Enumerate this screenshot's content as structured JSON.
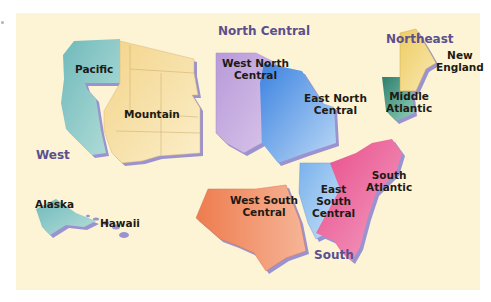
{
  "map": {
    "title": "United States Census Regions and Divisions",
    "regions": [
      {
        "name": "West",
        "divisions": [
          "Pacific",
          "Mountain"
        ]
      },
      {
        "name": "North Central",
        "divisions": [
          "West North Central",
          "East North Central"
        ]
      },
      {
        "name": "Northeast",
        "divisions": [
          "New England",
          "Middle Atlantic"
        ]
      },
      {
        "name": "South",
        "divisions": [
          "West South Central",
          "East South Central",
          "South Atlantic"
        ]
      }
    ],
    "region_labels": {
      "west": "West",
      "north_central": "North Central",
      "northeast": "Northeast",
      "south": "South"
    },
    "division_labels": {
      "pacific": "Pacific",
      "mountain": "Mountain",
      "alaska": "Alaska",
      "hawaii": "Hawaii",
      "wnc_1": "West North",
      "wnc_2": "Central",
      "enc_1": "East North",
      "enc_2": "Central",
      "ne_1": "New",
      "ne_2": "England",
      "ma_1": "Middle",
      "ma_2": "Atlantic",
      "wsc_1": "West South",
      "wsc_2": "Central",
      "esc_1": "East",
      "esc_2": "South",
      "esc_3": "Central",
      "sa_1": "South",
      "sa_2": "Atlantic"
    },
    "colors": {
      "background": "#fdf4d6",
      "shadow": "#9b93cf",
      "pacific": "#8ccbc8",
      "mountain": "#f6dfa0",
      "west_north_central": "#c3a7dd",
      "east_north_central": "#5c9be8",
      "new_england": "#f2d879",
      "middle_atlantic": "#3e9a83",
      "west_south_central": "#ef8a5e",
      "east_south_central": "#8fc0f0",
      "south_atlantic": "#ec5f93",
      "region_label": "#5b4f8e",
      "division_label": "#1e1a14"
    }
  }
}
